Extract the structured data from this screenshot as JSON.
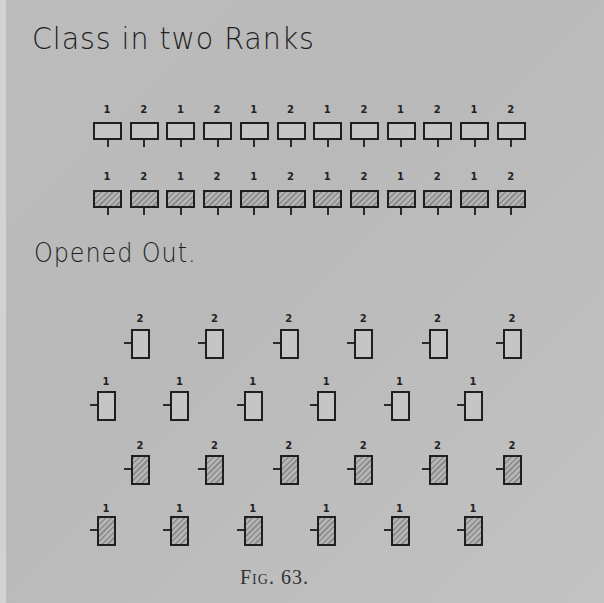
{
  "headings": {
    "title": "Class in two Ranks",
    "subtitle": "Opened Out.",
    "caption": "Fig. 63."
  },
  "ranks": {
    "front_rank": {
      "style": "open",
      "labels": [
        "1",
        "2",
        "1",
        "2",
        "1",
        "2",
        "1",
        "2",
        "1",
        "2",
        "1",
        "2"
      ]
    },
    "rear_rank": {
      "style": "hatched",
      "labels": [
        "1",
        "2",
        "1",
        "2",
        "1",
        "2",
        "1",
        "2",
        "1",
        "2",
        "1",
        "2"
      ]
    }
  },
  "opened_out": {
    "rows": [
      {
        "style": "open",
        "labels": [
          "2",
          "2",
          "2",
          "2",
          "2",
          "2"
        ]
      },
      {
        "style": "open",
        "labels": [
          "1",
          "1",
          "1",
          "1",
          "1",
          "1"
        ]
      },
      {
        "style": "hatched",
        "labels": [
          "2",
          "2",
          "2",
          "2",
          "2",
          "2"
        ]
      },
      {
        "style": "hatched",
        "labels": [
          "1",
          "1",
          "1",
          "1",
          "1",
          "1"
        ]
      }
    ]
  },
  "colors": {
    "background": "#bcbcbc",
    "ink": "#1f1f1f",
    "hatch": "#8e8e8e"
  }
}
